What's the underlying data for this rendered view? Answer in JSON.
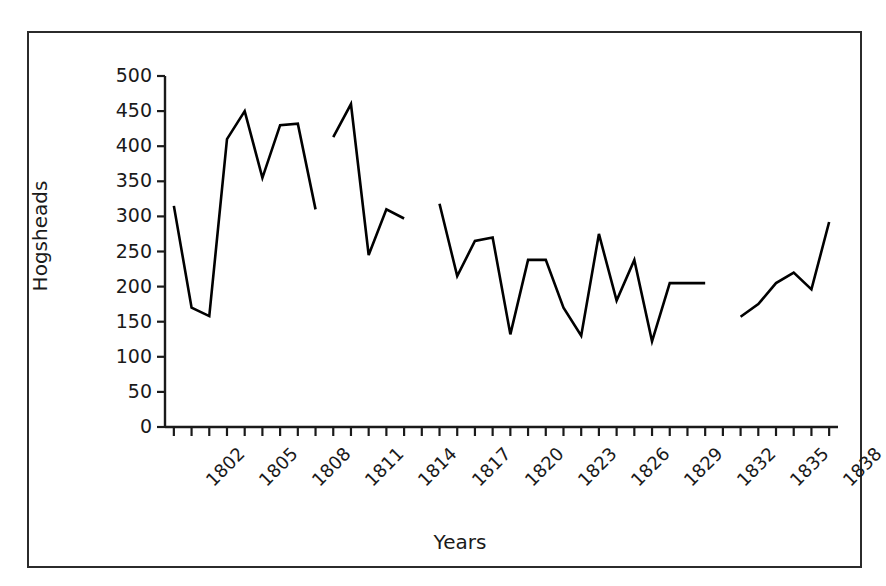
{
  "chart_data": {
    "type": "line",
    "title": "",
    "xlabel": "Years",
    "ylabel": "Hogsheads",
    "xlim": [
      1801.5,
      1839.5
    ],
    "ylim": [
      0,
      500
    ],
    "grid": false,
    "legend": "none",
    "line_color": "#000000",
    "y_ticks": [
      0,
      50,
      100,
      150,
      200,
      250,
      300,
      350,
      400,
      450,
      500
    ],
    "y_tick_labels": [
      "0",
      "50",
      "100",
      "150",
      "200",
      "250",
      "300",
      "350",
      "400",
      "450",
      "500"
    ],
    "x_ticks": [
      1802,
      1803,
      1804,
      1805,
      1806,
      1807,
      1808,
      1809,
      1810,
      1811,
      1812,
      1813,
      1814,
      1815,
      1816,
      1817,
      1818,
      1819,
      1820,
      1821,
      1822,
      1823,
      1824,
      1825,
      1826,
      1827,
      1828,
      1829,
      1830,
      1831,
      1832,
      1833,
      1834,
      1835,
      1836,
      1837,
      1838,
      1839
    ],
    "x_tick_labels_shown": [
      "1802",
      "1805",
      "1808",
      "1811",
      "1814",
      "1817",
      "1820",
      "1823",
      "1826",
      "1829",
      "1832",
      "1835",
      "1838"
    ],
    "x_tick_label_interval": 3,
    "x_tick_label_rotation": -45,
    "series": [
      {
        "name": "Hogsheads",
        "x": [
          1802,
          1803,
          1804,
          1805,
          1806,
          1807,
          1808,
          1809,
          1810
        ],
        "values": [
          315,
          170,
          158,
          410,
          450,
          355,
          430,
          432,
          310
        ]
      },
      {
        "name": "Hogsheads",
        "x": [
          1811,
          1812,
          1813,
          1814,
          1815
        ],
        "values": [
          413,
          460,
          245,
          310,
          297
        ]
      },
      {
        "name": "Hogsheads",
        "x": [
          1817,
          1818,
          1819,
          1820,
          1821,
          1822,
          1823,
          1824,
          1825,
          1826,
          1827,
          1828,
          1829,
          1830,
          1831,
          1832
        ],
        "values": [
          318,
          215,
          265,
          270,
          132,
          238,
          238,
          170,
          130,
          275,
          180,
          238,
          122,
          205,
          205,
          205
        ]
      },
      {
        "name": "Hogsheads",
        "x": [
          1834,
          1835,
          1836,
          1837,
          1838,
          1839
        ],
        "values": [
          157,
          175,
          205,
          220,
          196,
          292
        ]
      }
    ]
  },
  "axes": {
    "y_title": "Hogsheads",
    "x_title": "Years"
  }
}
